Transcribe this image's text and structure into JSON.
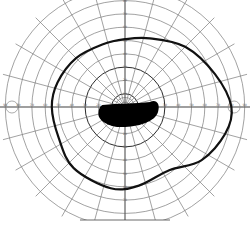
{
  "chart_data": {
    "type": "polar-visual-field",
    "title": "",
    "center_px": [
      125,
      107
    ],
    "degrees_per_ring": 10,
    "rings_deg": [
      10,
      20,
      30,
      40,
      50,
      60,
      70,
      80,
      90
    ],
    "major_rings_deg": [
      10,
      30
    ],
    "meridian_step_deg": 15,
    "horizontal_tick_labels": [
      "90",
      "80",
      "70",
      "60",
      "50",
      "40",
      "30",
      "20",
      "10",
      "10",
      "20",
      "30",
      "40",
      "50",
      "60",
      "70",
      "80",
      "90"
    ],
    "vertical_tick_labels": [
      "90",
      "80",
      "70",
      "60",
      "50",
      "40",
      "30",
      "20",
      "10",
      "10",
      "20",
      "30",
      "40",
      "50",
      "60",
      "70"
    ],
    "isopter": {
      "label": "peripheral isopter",
      "points_deg": [
        {
          "angle": 0,
          "ecc": 80
        },
        {
          "angle": 20,
          "ecc": 72
        },
        {
          "angle": 45,
          "ecc": 64
        },
        {
          "angle": 70,
          "ecc": 55
        },
        {
          "angle": 90,
          "ecc": 51
        },
        {
          "angle": 110,
          "ecc": 50
        },
        {
          "angle": 135,
          "ecc": 52
        },
        {
          "angle": 160,
          "ecc": 54
        },
        {
          "angle": 180,
          "ecc": 55
        },
        {
          "angle": 205,
          "ecc": 55
        },
        {
          "angle": 230,
          "ecc": 60
        },
        {
          "angle": 260,
          "ecc": 62
        },
        {
          "angle": 280,
          "ecc": 60
        },
        {
          "angle": 305,
          "ecc": 58
        },
        {
          "angle": 325,
          "ecc": 70
        },
        {
          "angle": 345,
          "ecc": 78
        }
      ]
    },
    "scotoma": {
      "label": "central scotoma",
      "extent_deg": {
        "left": 20,
        "right": 25,
        "top": 3,
        "bottom": 15
      }
    },
    "blind_spot_markers": [
      {
        "side": "right",
        "ecc": 82
      },
      {
        "side": "left",
        "ecc": 85
      }
    ],
    "colors": {
      "grid": "#7a7a7a",
      "isopter": "#111111",
      "scotoma": "#000000",
      "background": "#ffffff"
    }
  }
}
